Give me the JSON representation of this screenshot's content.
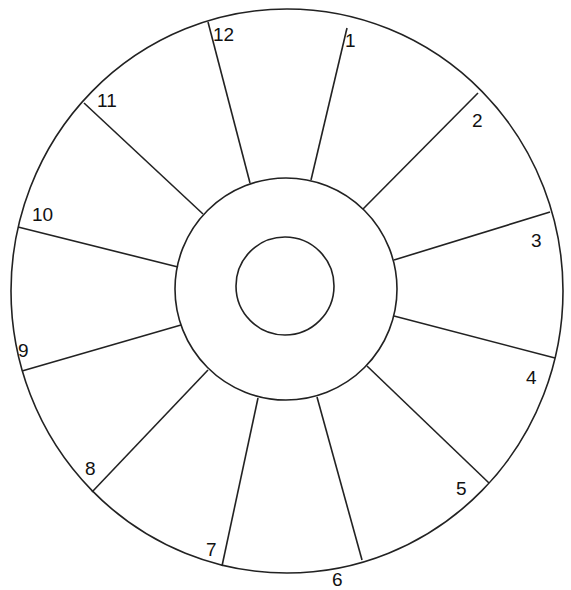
{
  "diagram": {
    "outer": {
      "cx": 287,
      "cy": 291,
      "rx": 276,
      "ry": 282
    },
    "middle": {
      "cx": 286,
      "cy": 289,
      "r": 111
    },
    "inner": {
      "cx": 285,
      "cy": 286,
      "r": 49
    },
    "stroke": "#222222",
    "spokes": [
      {
        "x1": 208,
        "y1": 22,
        "x2": 250,
        "y2": 183
      },
      {
        "x1": 347,
        "y1": 28,
        "x2": 311,
        "y2": 180
      },
      {
        "x1": 478,
        "y1": 93,
        "x2": 363,
        "y2": 209
      },
      {
        "x1": 550,
        "y1": 212,
        "x2": 394,
        "y2": 260
      },
      {
        "x1": 555,
        "y1": 358,
        "x2": 394,
        "y2": 316
      },
      {
        "x1": 489,
        "y1": 483,
        "x2": 367,
        "y2": 366
      },
      {
        "x1": 362,
        "y1": 560,
        "x2": 317,
        "y2": 397
      },
      {
        "x1": 222,
        "y1": 566,
        "x2": 258,
        "y2": 398
      },
      {
        "x1": 92,
        "y1": 492,
        "x2": 208,
        "y2": 370
      },
      {
        "x1": 22,
        "y1": 371,
        "x2": 181,
        "y2": 325
      },
      {
        "x1": 18,
        "y1": 227,
        "x2": 178,
        "y2": 267
      },
      {
        "x1": 84,
        "y1": 103,
        "x2": 203,
        "y2": 214
      }
    ],
    "labels": [
      {
        "text": "12",
        "x": 213,
        "y": 25
      },
      {
        "text": "1",
        "x": 345,
        "y": 31
      },
      {
        "text": "2",
        "x": 472,
        "y": 111
      },
      {
        "text": "3",
        "x": 531,
        "y": 231
      },
      {
        "text": "4",
        "x": 526,
        "y": 368
      },
      {
        "text": "5",
        "x": 456,
        "y": 479
      },
      {
        "text": "6",
        "x": 332,
        "y": 570
      },
      {
        "text": "7",
        "x": 206,
        "y": 540
      },
      {
        "text": "8",
        "x": 85,
        "y": 459
      },
      {
        "text": "9",
        "x": 18,
        "y": 341
      },
      {
        "text": "10",
        "x": 32,
        "y": 205
      },
      {
        "text": "11",
        "x": 97,
        "y": 91
      }
    ]
  }
}
